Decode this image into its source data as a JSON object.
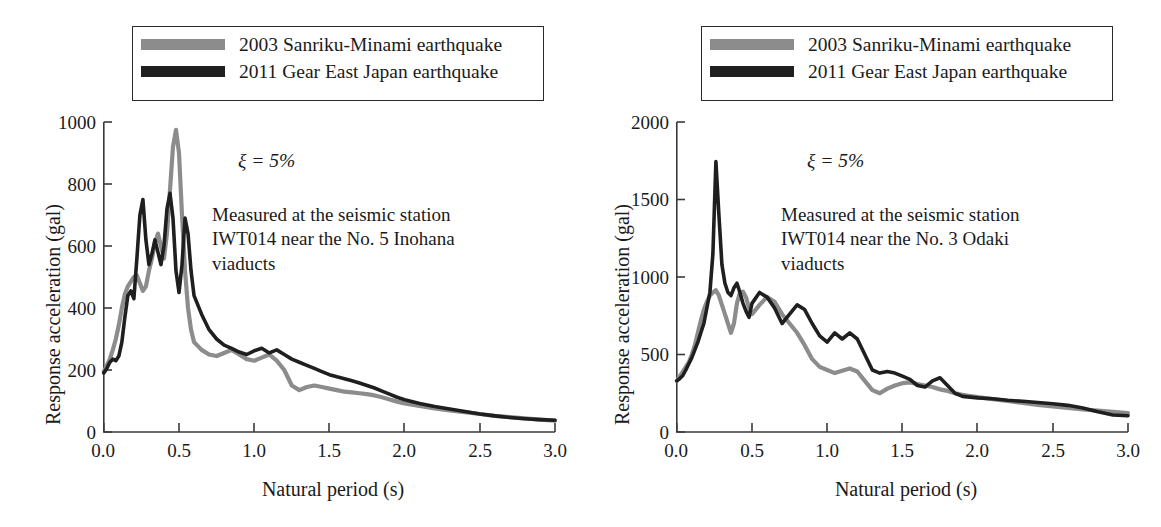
{
  "figure": {
    "colors": {
      "series_2003": "#8c8c8c",
      "series_2011": "#1f1f1f",
      "axis": "#3a3a3a",
      "text": "#1a1a1a"
    }
  },
  "legend": {
    "items": [
      {
        "label": "2003 Sanriku-Minami earthquake",
        "color": "#8c8c8c"
      },
      {
        "label": "2011 Gear East Japan earthquake",
        "color": "#1f1f1f"
      }
    ]
  },
  "panels": [
    {
      "id": "left",
      "damping": "ξ = 5%",
      "annotation": "Measured at the seismic station\nIWT014 near the No. 5 Inohana\nviaducts",
      "xlabel": "Natural period (s)",
      "ylabel": "Response acceleration (gal)",
      "xticks": [
        "0.0",
        "0.5",
        "1.0",
        "1.5",
        "2.0",
        "2.5",
        "3.0"
      ],
      "yticks": [
        "0",
        "200",
        "400",
        "600",
        "800",
        "1000"
      ]
    },
    {
      "id": "right",
      "damping": "ξ = 5%",
      "annotation": "Measured at the seismic station\nIWT014 near the No. 3 Odaki\nviaducts",
      "xlabel": "Natural period (s)",
      "ylabel": "Response acceleration (gal)",
      "xticks": [
        "0.0",
        "0.5",
        "1.0",
        "1.5",
        "2.0",
        "2.5",
        "3.0"
      ],
      "yticks": [
        "0",
        "500",
        "1000",
        "1500",
        "2000"
      ]
    }
  ],
  "chart_data": [
    {
      "type": "line",
      "id": "left-inohana",
      "title": "",
      "xlabel": "Natural period (s)",
      "ylabel": "Response acceleration (gal)",
      "xlim": [
        0.0,
        3.0
      ],
      "ylim": [
        0,
        1000
      ],
      "xticks": [
        0.0,
        0.5,
        1.0,
        1.5,
        2.0,
        2.5,
        3.0
      ],
      "yticks": [
        0,
        200,
        400,
        600,
        800,
        1000
      ],
      "grid": false,
      "legend_position": "above-plot",
      "annotations": [
        "ξ = 5%",
        "Measured at the seismic station IWT014 near the No. 5 Inohana viaducts"
      ],
      "series": [
        {
          "name": "2003 Sanriku-Minami earthquake",
          "color": "#8c8c8c",
          "x": [
            0.0,
            0.02,
            0.04,
            0.06,
            0.08,
            0.1,
            0.12,
            0.14,
            0.16,
            0.18,
            0.2,
            0.22,
            0.24,
            0.26,
            0.28,
            0.3,
            0.32,
            0.34,
            0.36,
            0.38,
            0.4,
            0.42,
            0.44,
            0.46,
            0.48,
            0.5,
            0.52,
            0.54,
            0.56,
            0.58,
            0.6,
            0.65,
            0.7,
            0.75,
            0.8,
            0.85,
            0.9,
            0.95,
            1.0,
            1.05,
            1.1,
            1.15,
            1.2,
            1.25,
            1.3,
            1.35,
            1.4,
            1.45,
            1.5,
            1.55,
            1.6,
            1.65,
            1.7,
            1.75,
            1.8,
            1.85,
            1.9,
            1.95,
            2.0,
            2.1,
            2.2,
            2.3,
            2.4,
            2.5,
            2.6,
            2.7,
            2.8,
            2.9,
            3.0
          ],
          "y": [
            195,
            215,
            235,
            265,
            300,
            345,
            400,
            445,
            470,
            485,
            500,
            505,
            480,
            455,
            470,
            520,
            560,
            610,
            640,
            600,
            560,
            640,
            780,
            920,
            975,
            900,
            700,
            520,
            400,
            330,
            290,
            265,
            250,
            245,
            255,
            265,
            250,
            235,
            230,
            240,
            250,
            230,
            200,
            150,
            135,
            145,
            150,
            145,
            140,
            135,
            130,
            128,
            125,
            122,
            118,
            112,
            105,
            98,
            92,
            84,
            76,
            70,
            64,
            58,
            52,
            48,
            44,
            40,
            37
          ]
        },
        {
          "name": "2011 Gear East Japan earthquake",
          "color": "#1f1f1f",
          "x": [
            0.0,
            0.02,
            0.04,
            0.06,
            0.08,
            0.1,
            0.12,
            0.14,
            0.16,
            0.18,
            0.2,
            0.22,
            0.24,
            0.26,
            0.28,
            0.3,
            0.32,
            0.34,
            0.36,
            0.38,
            0.4,
            0.42,
            0.44,
            0.46,
            0.48,
            0.5,
            0.52,
            0.54,
            0.56,
            0.58,
            0.6,
            0.65,
            0.7,
            0.75,
            0.8,
            0.85,
            0.9,
            0.95,
            1.0,
            1.05,
            1.1,
            1.15,
            1.2,
            1.25,
            1.3,
            1.35,
            1.4,
            1.45,
            1.5,
            1.55,
            1.6,
            1.65,
            1.7,
            1.75,
            1.8,
            1.85,
            1.9,
            1.95,
            2.0,
            2.1,
            2.2,
            2.3,
            2.4,
            2.5,
            2.6,
            2.7,
            2.8,
            2.9,
            3.0
          ],
          "y": [
            190,
            205,
            225,
            235,
            230,
            245,
            290,
            370,
            440,
            455,
            430,
            560,
            700,
            750,
            620,
            540,
            575,
            620,
            580,
            540,
            600,
            720,
            770,
            690,
            520,
            450,
            540,
            690,
            640,
            520,
            440,
            380,
            330,
            300,
            280,
            270,
            258,
            250,
            262,
            270,
            255,
            265,
            250,
            235,
            225,
            215,
            205,
            195,
            185,
            178,
            172,
            165,
            158,
            150,
            142,
            132,
            122,
            112,
            104,
            92,
            82,
            74,
            66,
            58,
            52,
            47,
            43,
            40,
            38
          ]
        }
      ]
    },
    {
      "type": "line",
      "id": "right-odaki",
      "title": "",
      "xlabel": "Natural period (s)",
      "ylabel": "Response acceleration (gal)",
      "xlim": [
        0.0,
        3.0
      ],
      "ylim": [
        0,
        2000
      ],
      "xticks": [
        0.0,
        0.5,
        1.0,
        1.5,
        2.0,
        2.5,
        3.0
      ],
      "yticks": [
        0,
        500,
        1000,
        1500,
        2000
      ],
      "grid": false,
      "legend_position": "above-plot",
      "annotations": [
        "ξ = 5%",
        "Measured at the seismic station IWT014 near the No. 3 Odaki viaducts"
      ],
      "series": [
        {
          "name": "2003 Sanriku-Minami earthquake",
          "color": "#8c8c8c",
          "x": [
            0.0,
            0.02,
            0.04,
            0.06,
            0.08,
            0.1,
            0.12,
            0.14,
            0.16,
            0.18,
            0.2,
            0.22,
            0.24,
            0.26,
            0.28,
            0.3,
            0.32,
            0.34,
            0.36,
            0.38,
            0.4,
            0.42,
            0.44,
            0.46,
            0.48,
            0.5,
            0.55,
            0.6,
            0.65,
            0.7,
            0.75,
            0.8,
            0.85,
            0.9,
            0.95,
            1.0,
            1.05,
            1.1,
            1.15,
            1.2,
            1.25,
            1.3,
            1.35,
            1.4,
            1.45,
            1.5,
            1.55,
            1.6,
            1.65,
            1.7,
            1.75,
            1.8,
            1.85,
            1.9,
            1.95,
            2.0,
            2.1,
            2.2,
            2.3,
            2.4,
            2.5,
            2.6,
            2.7,
            2.8,
            2.9,
            3.0
          ],
          "y": [
            330,
            360,
            390,
            420,
            450,
            500,
            560,
            640,
            720,
            790,
            840,
            880,
            900,
            915,
            880,
            820,
            760,
            700,
            640,
            700,
            830,
            900,
            905,
            870,
            800,
            760,
            820,
            870,
            840,
            760,
            700,
            640,
            560,
            470,
            420,
            400,
            380,
            395,
            410,
            390,
            330,
            270,
            250,
            280,
            300,
            315,
            320,
            310,
            300,
            290,
            275,
            265,
            250,
            240,
            232,
            225,
            212,
            200,
            188,
            175,
            165,
            155,
            145,
            138,
            130,
            122
          ]
        },
        {
          "name": "2011 Gear East Japan earthquake",
          "color": "#1f1f1f",
          "x": [
            0.0,
            0.02,
            0.04,
            0.06,
            0.08,
            0.1,
            0.12,
            0.14,
            0.16,
            0.18,
            0.2,
            0.22,
            0.24,
            0.26,
            0.28,
            0.3,
            0.32,
            0.34,
            0.36,
            0.38,
            0.4,
            0.42,
            0.44,
            0.46,
            0.48,
            0.5,
            0.55,
            0.6,
            0.65,
            0.7,
            0.75,
            0.8,
            0.85,
            0.9,
            0.95,
            1.0,
            1.05,
            1.1,
            1.15,
            1.2,
            1.25,
            1.3,
            1.35,
            1.4,
            1.45,
            1.5,
            1.55,
            1.6,
            1.65,
            1.7,
            1.75,
            1.8,
            1.85,
            1.9,
            1.95,
            2.0,
            2.1,
            2.2,
            2.3,
            2.4,
            2.5,
            2.6,
            2.7,
            2.8,
            2.9,
            3.0
          ],
          "y": [
            330,
            345,
            365,
            400,
            440,
            480,
            530,
            580,
            640,
            700,
            800,
            900,
            1150,
            1745,
            1400,
            1080,
            960,
            900,
            880,
            930,
            960,
            900,
            830,
            780,
            740,
            830,
            900,
            870,
            800,
            700,
            760,
            820,
            790,
            700,
            620,
            580,
            640,
            600,
            640,
            600,
            500,
            400,
            380,
            390,
            380,
            360,
            340,
            300,
            290,
            330,
            350,
            300,
            250,
            230,
            225,
            220,
            215,
            205,
            198,
            190,
            182,
            172,
            155,
            130,
            110,
            105
          ]
        }
      ]
    }
  ]
}
